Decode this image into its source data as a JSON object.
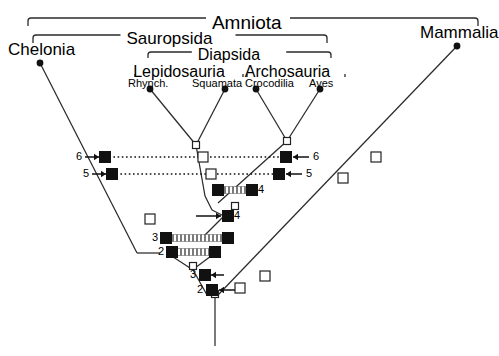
{
  "figure": {
    "type": "cladogram",
    "background": "#ffffff",
    "line_color": "#2b2b2b",
    "solid_node_color": "#111111",
    "open_node_color": "#ffffff"
  },
  "brackets": [
    {
      "id": "amniota",
      "label": "Amniota",
      "x1": 28,
      "x2": 478,
      "y": 18,
      "label_x": 248,
      "label_y": 13
    },
    {
      "id": "sauropsida",
      "label": "Sauropsida",
      "x1": 33,
      "x2": 327,
      "y": 35,
      "label_x": 178,
      "label_y": 30
    },
    {
      "id": "diapsida",
      "label": "Diapsida",
      "x1": 148,
      "x2": 331,
      "y": 52,
      "label_x": 239,
      "label_y": 47
    },
    {
      "id": "lepidosauria",
      "label": "Lepidosauria",
      "x1": 135,
      "x2": 243,
      "y": 69,
      "label_x": 189,
      "label_y": 64
    },
    {
      "id": "archosauria",
      "label": "Archosauria",
      "x1": 247,
      "x2": 345,
      "y": 69,
      "label_x": 296,
      "label_y": 64
    }
  ],
  "taxa": [
    {
      "id": "chelonia",
      "label": "Chelonia",
      "tip_x": 40,
      "tip_y": 63,
      "label_x": 8,
      "label_y": 41,
      "rank": "rank2"
    },
    {
      "id": "rhynch",
      "label": "Rhynch.",
      "tip_x": 150,
      "tip_y": 89,
      "label_x": 128,
      "label_y": 78,
      "rank": "rank4"
    },
    {
      "id": "squamata",
      "label": "Squamata",
      "tip_x": 225,
      "tip_y": 89,
      "label_x": 192,
      "label_y": 78,
      "rank": "rank4"
    },
    {
      "id": "crocodilia",
      "label": "Crocodilia",
      "tip_x": 256,
      "tip_y": 89,
      "label_x": 245,
      "label_y": 78,
      "rank": "rank4"
    },
    {
      "id": "aves",
      "label": "Aves",
      "tip_x": 320,
      "tip_y": 89,
      "label_x": 309,
      "label_y": 78,
      "rank": "rank4"
    },
    {
      "id": "mammalia",
      "label": "Mammalia",
      "tip_x": 457,
      "tip_y": 46,
      "label_x": 420,
      "label_y": 24,
      "rank": "rank2"
    }
  ],
  "branches": [
    {
      "id": "chelonia-stem",
      "x1": 40,
      "y1": 63,
      "x2": 137,
      "y2": 253
    },
    {
      "id": "rhynch-stem",
      "x1": 150,
      "y1": 89,
      "x2": 196,
      "y2": 145
    },
    {
      "id": "squamata-stem",
      "x1": 225,
      "y1": 89,
      "x2": 196,
      "y2": 145
    },
    {
      "id": "lepido-stem",
      "x1": 196,
      "y1": 145,
      "x2": 205,
      "y2": 196
    },
    {
      "id": "crocodilia-stem",
      "x1": 256,
      "y1": 89,
      "x2": 287,
      "y2": 141
    },
    {
      "id": "aves-stem",
      "x1": 320,
      "y1": 89,
      "x2": 287,
      "y2": 141
    },
    {
      "id": "archo-stem",
      "x1": 287,
      "y1": 141,
      "x2": 218,
      "y2": 203
    },
    {
      "id": "diapsid-stem",
      "x1": 205,
      "y1": 196,
      "x2": 212,
      "y2": 210
    },
    {
      "id": "diapsid-to-node4",
      "x1": 212,
      "y1": 210,
      "x2": 224,
      "y2": 216
    },
    {
      "id": "node4-down",
      "x1": 224,
      "y1": 216,
      "x2": 203,
      "y2": 237
    },
    {
      "id": "sauro-left",
      "x1": 137,
      "y1": 253,
      "x2": 160,
      "y2": 253
    },
    {
      "id": "sauro-tri-left",
      "x1": 167,
      "y1": 253,
      "x2": 190,
      "y2": 268
    },
    {
      "id": "sauro-tri-right",
      "x1": 215,
      "y1": 253,
      "x2": 195,
      "y2": 268
    },
    {
      "id": "crown-stem",
      "x1": 192,
      "y1": 268,
      "x2": 207,
      "y2": 295
    },
    {
      "id": "mammal-stem",
      "x1": 457,
      "y1": 46,
      "x2": 218,
      "y2": 295
    },
    {
      "id": "root-stem",
      "x1": 215,
      "y1": 295,
      "x2": 215,
      "y2": 346
    }
  ],
  "tie_bars": [
    {
      "id": "tie-node6",
      "x1": 105,
      "y1": 157,
      "x2": 286,
      "y2": 157,
      "style": "dotted"
    },
    {
      "id": "tie-node5",
      "x1": 112,
      "y1": 174,
      "x2": 279,
      "y2": 174,
      "style": "dotted"
    },
    {
      "id": "tie-node4-upper",
      "x1": 218,
      "y1": 190,
      "x2": 252,
      "y2": 190,
      "style": "hatched"
    },
    {
      "id": "tie-node3",
      "x1": 168,
      "y1": 238,
      "x2": 228,
      "y2": 238,
      "style": "hatched"
    },
    {
      "id": "tie-node2",
      "x1": 172,
      "y1": 252,
      "x2": 215,
      "y2": 252,
      "style": "hatched"
    }
  ],
  "solid_nodes": [
    {
      "id": "s-chelonia-6",
      "x": 105,
      "y": 157
    },
    {
      "id": "s-chelonia-5",
      "x": 112,
      "y": 174
    },
    {
      "id": "s-archo-6",
      "x": 286,
      "y": 157
    },
    {
      "id": "s-archo-5",
      "x": 279,
      "y": 174
    },
    {
      "id": "s-lepido-4",
      "x": 218,
      "y": 190
    },
    {
      "id": "s-archo-4",
      "x": 252,
      "y": 190
    },
    {
      "id": "s-mid-4",
      "x": 228,
      "y": 216
    },
    {
      "id": "s-left-3",
      "x": 166,
      "y": 238
    },
    {
      "id": "s-right-3",
      "x": 228,
      "y": 238
    },
    {
      "id": "s-left-2",
      "x": 172,
      "y": 252
    },
    {
      "id": "s-right-2",
      "x": 215,
      "y": 252
    },
    {
      "id": "s-stem-3",
      "x": 205,
      "y": 275
    },
    {
      "id": "s-stem-2",
      "x": 212,
      "y": 290
    }
  ],
  "open_nodes": [
    {
      "id": "o-lepido-crown",
      "x": 196,
      "y": 145,
      "size": 7
    },
    {
      "id": "o-archo-crown",
      "x": 287,
      "y": 141,
      "size": 7
    },
    {
      "id": "o-lepido-6",
      "x": 203,
      "y": 157,
      "size": 10
    },
    {
      "id": "o-lepido-5",
      "x": 211,
      "y": 174,
      "size": 10
    },
    {
      "id": "o-diapsid",
      "x": 235,
      "y": 206,
      "size": 7
    },
    {
      "id": "o-left-3",
      "x": 150,
      "y": 219,
      "size": 10
    },
    {
      "id": "o-sauro-tri",
      "x": 193,
      "y": 266,
      "size": 7
    },
    {
      "id": "o-root",
      "x": 215,
      "y": 294,
      "size": 7
    },
    {
      "id": "o-mam-low",
      "x": 240,
      "y": 288,
      "size": 10
    },
    {
      "id": "o-mam-mid",
      "x": 265,
      "y": 276,
      "size": 10
    },
    {
      "id": "o-mam-up1",
      "x": 343,
      "y": 178,
      "size": 10
    },
    {
      "id": "o-mam-up2",
      "x": 376,
      "y": 157,
      "size": 10
    }
  ],
  "markers": [
    {
      "id": "m6-left",
      "number": "6",
      "num_x": 76,
      "num_y": 151,
      "arrow_x1": 85,
      "arrow_x2": 99,
      "arrow_y": 157,
      "dir": "right"
    },
    {
      "id": "m5-left",
      "number": "5",
      "num_x": 83,
      "num_y": 168,
      "arrow_x1": 92,
      "arrow_x2": 106,
      "arrow_y": 174,
      "dir": "right"
    },
    {
      "id": "m6-right",
      "number": "6",
      "num_x": 313,
      "num_y": 151,
      "arrow_x1": 309,
      "arrow_x2": 293,
      "arrow_y": 157,
      "dir": "left"
    },
    {
      "id": "m5-right",
      "number": "5",
      "num_x": 306,
      "num_y": 168,
      "arrow_x1": 302,
      "arrow_x2": 286,
      "arrow_y": 174,
      "dir": "left"
    },
    {
      "id": "m4-archo",
      "number": "4",
      "num_x": 258,
      "num_y": 184,
      "arrow_x1": null,
      "arrow_x2": null,
      "arrow_y": null,
      "dir": "none"
    },
    {
      "id": "m4-mid",
      "number": "4",
      "num_x": 234,
      "num_y": 210,
      "arrow_x1": 196,
      "arrow_x2": 221,
      "arrow_y": 216,
      "dir": "right"
    },
    {
      "id": "m3-bar",
      "number": "3",
      "num_x": 152,
      "num_y": 232,
      "arrow_x1": null,
      "arrow_x2": null,
      "arrow_y": null,
      "dir": "none"
    },
    {
      "id": "m2-bar",
      "number": "2",
      "num_x": 158,
      "num_y": 246,
      "arrow_x1": null,
      "arrow_x2": null,
      "arrow_y": null,
      "dir": "none"
    },
    {
      "id": "m3-stem",
      "number": "3",
      "num_x": 190,
      "num_y": 269,
      "arrow_x1": 224,
      "arrow_x2": 211,
      "arrow_y": 275,
      "dir": "left"
    },
    {
      "id": "m2-stem",
      "number": "2",
      "num_x": 197,
      "num_y": 284,
      "arrow_x1": 235,
      "arrow_x2": 219,
      "arrow_y": 290,
      "dir": "left"
    }
  ]
}
